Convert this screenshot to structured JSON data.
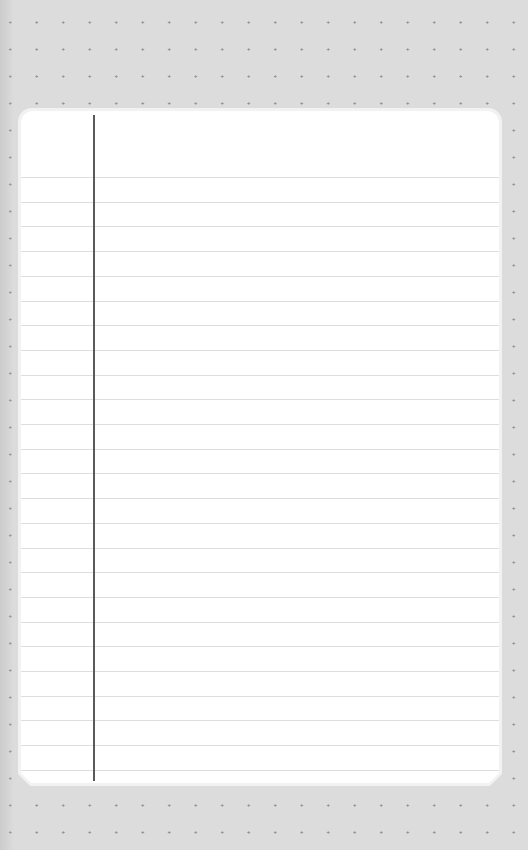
{
  "page": {
    "background": "dotted-grey",
    "background_color": "#dcdcdc",
    "dot_color": "#8f8f8f"
  },
  "notepad": {
    "title": "",
    "paper_color": "#ffffff",
    "rule_color": "#dedede",
    "margin_line_color": "#5a5a5a",
    "rule_count": 25,
    "first_rule_offset_px": 66,
    "rule_spacing_px": 24.7,
    "lines": [
      "",
      "",
      "",
      "",
      "",
      "",
      "",
      "",
      "",
      "",
      "",
      "",
      "",
      "",
      "",
      "",
      "",
      "",
      "",
      "",
      "",
      "",
      "",
      "",
      ""
    ]
  }
}
